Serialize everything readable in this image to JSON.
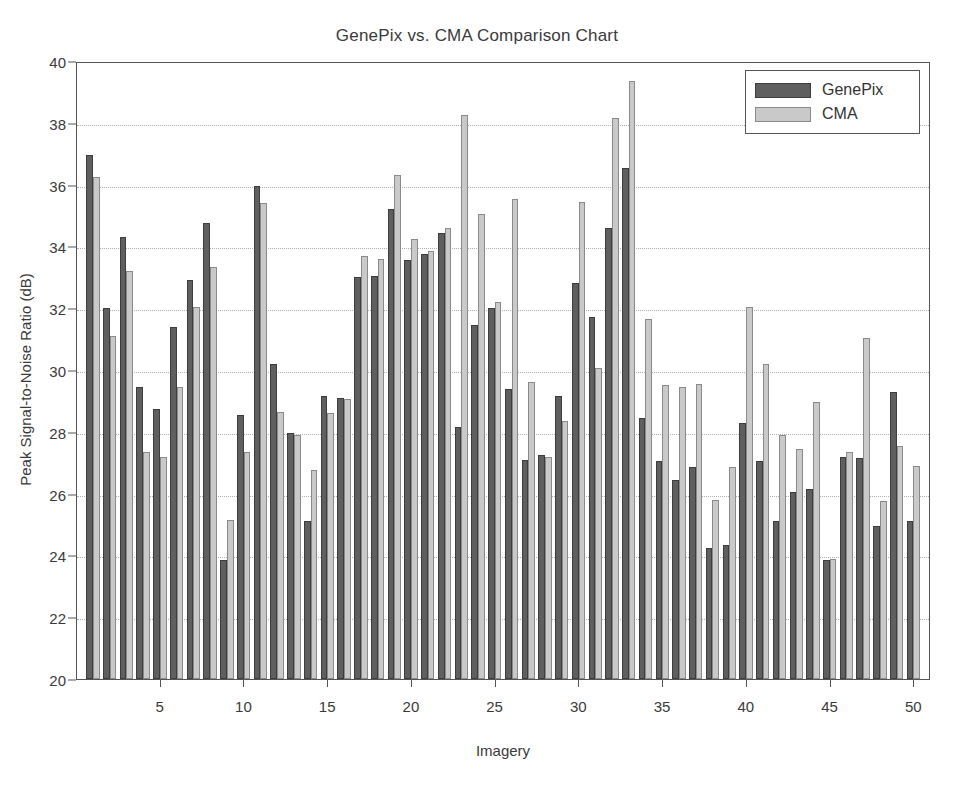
{
  "chart_data": {
    "type": "bar",
    "title": "GenePix vs. CMA Comparison Chart",
    "xlabel": "Imagery",
    "ylabel": "Peak Signal-to-Noise Ratio (dB)",
    "ylim": [
      20,
      40
    ],
    "xlim": [
      0,
      51
    ],
    "ytick_labels": [
      "20",
      "22",
      "24",
      "26",
      "28",
      "30",
      "32",
      "34",
      "36",
      "38",
      "40"
    ],
    "ytick_values": [
      20,
      22,
      24,
      26,
      28,
      30,
      32,
      34,
      36,
      38,
      40
    ],
    "xtick_labels": [
      "5",
      "10",
      "15",
      "20",
      "25",
      "30",
      "35",
      "40",
      "45",
      "50"
    ],
    "xtick_values": [
      5,
      10,
      15,
      20,
      25,
      30,
      35,
      40,
      45,
      50
    ],
    "grid": true,
    "grid_axis": "y",
    "legend_position": "top-right",
    "categories": [
      1,
      2,
      3,
      4,
      5,
      6,
      7,
      8,
      9,
      10,
      11,
      12,
      13,
      14,
      15,
      16,
      17,
      18,
      19,
      20,
      21,
      22,
      23,
      24,
      25,
      26,
      27,
      28,
      29,
      30,
      31,
      32,
      33,
      34,
      35,
      36,
      37,
      38,
      39,
      40,
      41,
      42,
      43,
      44,
      45,
      46,
      47,
      48,
      49,
      50
    ],
    "series": [
      {
        "name": "GenePix",
        "color": "#5f5f5f",
        "values": [
          36.95,
          32.0,
          34.3,
          29.45,
          28.75,
          31.4,
          32.9,
          34.75,
          23.85,
          28.55,
          35.95,
          30.2,
          27.95,
          25.1,
          29.15,
          29.1,
          33.0,
          33.05,
          35.2,
          33.55,
          33.75,
          34.45,
          28.15,
          31.45,
          32.0,
          29.4,
          27.1,
          27.25,
          29.15,
          32.8,
          31.7,
          34.6,
          36.55,
          28.45,
          27.05,
          26.45,
          26.85,
          24.25,
          24.35,
          28.3,
          27.05,
          25.1,
          26.05,
          26.15,
          23.85,
          27.2,
          27.15,
          24.95,
          29.3,
          25.1
        ]
      },
      {
        "name": "CMA",
        "color": "#c9c9c9",
        "values": [
          36.25,
          31.1,
          33.2,
          27.35,
          27.2,
          29.45,
          32.05,
          33.35,
          25.15,
          27.35,
          35.4,
          28.65,
          27.9,
          26.75,
          28.6,
          29.05,
          33.7,
          33.6,
          36.3,
          34.25,
          33.85,
          34.6,
          38.25,
          35.05,
          32.2,
          35.55,
          29.6,
          27.2,
          28.35,
          35.45,
          30.05,
          38.15,
          39.35,
          31.65,
          29.5,
          29.45,
          29.55,
          25.8,
          26.85,
          32.05,
          30.2,
          27.9,
          27.45,
          28.95,
          23.9,
          27.35,
          31.05,
          25.75,
          27.55,
          26.9
        ]
      }
    ]
  },
  "legend": {
    "items": [
      {
        "label": "GenePix",
        "swatch": "gp"
      },
      {
        "label": "CMA",
        "swatch": "cma"
      }
    ]
  }
}
